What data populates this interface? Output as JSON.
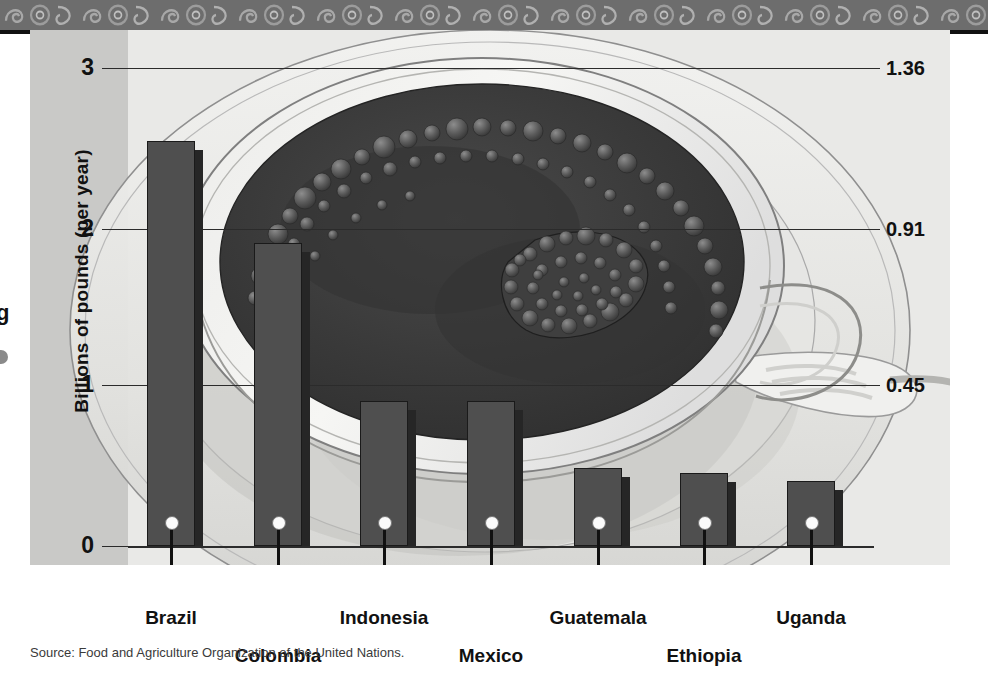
{
  "figure": {
    "source_note": "Source: Food and Agriculture Organization of the United Nations.",
    "edge_glyph": "g"
  },
  "axes": {
    "left_title": "Billions of pounds (per year)",
    "right_title": "Billions of kilograms (per year)",
    "left_ticks": [
      "3",
      "2",
      "1",
      "0"
    ],
    "right_ticks": [
      "1.36",
      "0.91",
      "0.45"
    ]
  },
  "colors": {
    "panel_background": "#d8d8d6",
    "plot_background": "#e9e9e7",
    "axis_strip": "#c9c9c7",
    "bar_fill": "#4f4f4f",
    "bar_shadow": "#262626",
    "axis_line": "#2b2b2b",
    "text": "#111111",
    "band": "#6d6d6d",
    "coffee": "#3b3b3b"
  },
  "chart_data": {
    "type": "bar",
    "title": "",
    "subtitle": "",
    "xlabel": "",
    "ylabel": "Billions of pounds (per year)",
    "ylabel_secondary": "Billions of kilograms (per year)",
    "categories": [
      "Brazil",
      "Colombia",
      "Indonesia",
      "Mexico",
      "Guatemala",
      "Ethiopia",
      "Uganda"
    ],
    "values": [
      2.54,
      1.9,
      0.91,
      0.91,
      0.49,
      0.46,
      0.41
    ],
    "values_secondary": [
      1.15,
      0.86,
      0.41,
      0.41,
      0.22,
      0.21,
      0.19
    ],
    "units": "billions of pounds per year",
    "ylim": [
      0,
      3.1
    ],
    "yticks": [
      0,
      1,
      2,
      3
    ],
    "ytick_labels": [
      "0",
      "1",
      "2",
      "3"
    ],
    "ylim_secondary": [
      0,
      1.41
    ],
    "yticks_secondary": [
      0.45,
      0.91,
      1.36
    ],
    "ytick_labels_secondary": [
      "0.45",
      "0.91",
      "1.36"
    ],
    "grid": true,
    "legend": "none",
    "source": "Food and Agriculture Organization of the United Nations."
  },
  "bars": [
    {
      "label": "Brazil",
      "value": 2.54,
      "label_row": 0
    },
    {
      "label": "Colombia",
      "value": 1.9,
      "label_row": 1
    },
    {
      "label": "Indonesia",
      "value": 0.91,
      "label_row": 0
    },
    {
      "label": "Mexico",
      "value": 0.91,
      "label_row": 1
    },
    {
      "label": "Guatemala",
      "value": 0.49,
      "label_row": 0
    },
    {
      "label": "Ethiopia",
      "value": 0.46,
      "label_row": 1
    },
    {
      "label": "Uganda",
      "value": 0.41,
      "label_row": 0
    }
  ]
}
